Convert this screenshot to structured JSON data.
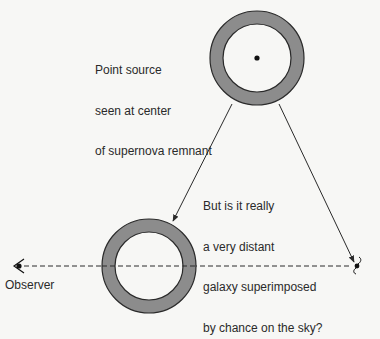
{
  "diagram": {
    "type": "schematic",
    "colors": {
      "background": "#f7f7f5",
      "ring_fill": "#8c8c8c",
      "line": "#2a2a2a",
      "text": "#2a2a2a"
    },
    "annotations": {
      "point_source": {
        "lines": [
          "Point source",
          "seen at center",
          "of supernova remnant"
        ]
      },
      "question": {
        "lines": [
          "But is it really",
          "a very distant",
          "galaxy superimposed",
          "by chance on the sky?"
        ]
      },
      "observer": "Observer"
    },
    "elements": {
      "remnant_apparent": {
        "cx": 257,
        "cy": 58,
        "r_outer": 47,
        "r_inner": 34,
        "has_center_point": true
      },
      "remnant_actual": {
        "cx": 149,
        "cy": 266,
        "r_outer": 47,
        "r_inner": 34,
        "has_center_point": false
      },
      "line_of_sight": {
        "x1": 24,
        "y1": 266,
        "x2": 352,
        "y2": 266,
        "style": "dashed"
      },
      "arrow_to_remnant": {
        "x1": 232,
        "y1": 104,
        "x2": 173,
        "y2": 221
      },
      "arrow_to_galaxy": {
        "x1": 279,
        "y1": 104,
        "x2": 354,
        "y2": 262
      },
      "galaxy_symbol": {
        "x": 357,
        "y": 266,
        "icon": "spiral-galaxy-icon"
      },
      "observer_eye": {
        "x": 20,
        "y": 266,
        "icon": "eye-icon"
      }
    }
  }
}
